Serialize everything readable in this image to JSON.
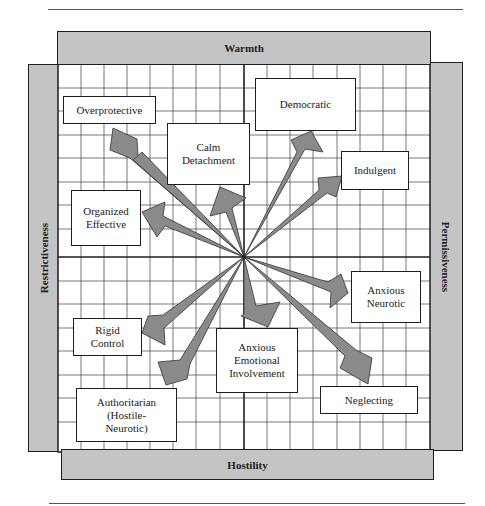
{
  "diagram": {
    "axes": {
      "top": "Warmth",
      "bottom": "Hostility",
      "left": "Restrictiveness",
      "right": "Permissiveness"
    },
    "center": "origin",
    "nodes": [
      {
        "id": "overprotective",
        "label": "Overprotective",
        "quadrant": "warmth-restrictiveness"
      },
      {
        "id": "calm-detachment",
        "label": "Calm\nDetachment",
        "quadrant": "warmth-restrictiveness"
      },
      {
        "id": "organized-effective",
        "label": "Organized\nEffective",
        "quadrant": "warmth-restrictiveness"
      },
      {
        "id": "democratic",
        "label": "Democratic",
        "quadrant": "warmth-permissiveness"
      },
      {
        "id": "indulgent",
        "label": "Indulgent",
        "quadrant": "warmth-permissiveness"
      },
      {
        "id": "anxious-neurotic",
        "label": "Anxious\nNeurotic",
        "quadrant": "hostility-permissiveness"
      },
      {
        "id": "neglecting",
        "label": "Neglecting",
        "quadrant": "hostility-permissiveness"
      },
      {
        "id": "anxious-emotional-involvement",
        "label": "Anxious\nEmotional\nInvolvement",
        "quadrant": "hostility-permissiveness"
      },
      {
        "id": "rigid-control",
        "label": "Rigid\nControl",
        "quadrant": "hostility-restrictiveness"
      },
      {
        "id": "authoritarian",
        "label": "Authoritarian\n(Hostile-\nNeurotic)",
        "quadrant": "hostility-restrictiveness"
      }
    ],
    "colors": {
      "band": "#c4c4c4",
      "arrow": "#8a8a8a",
      "outline": "#1e1e1e",
      "grid": "#444444"
    }
  }
}
